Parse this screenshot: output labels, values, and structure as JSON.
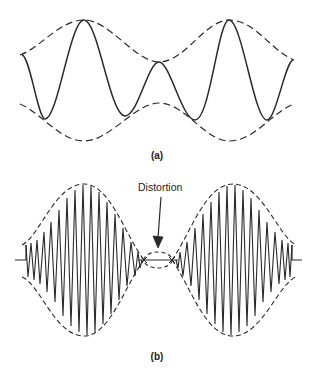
{
  "figure": {
    "panel_a": {
      "label": "(a)",
      "description": "Carrier waveform with dashed upper and lower envelopes"
    },
    "panel_b": {
      "label": "(b)",
      "annotation": "Distortion",
      "description": "High-frequency modulated waveform with dashed envelope; distortion region at envelope crossover"
    },
    "colors": {
      "line": "#2a2a2a",
      "background": "#ffffff"
    }
  }
}
